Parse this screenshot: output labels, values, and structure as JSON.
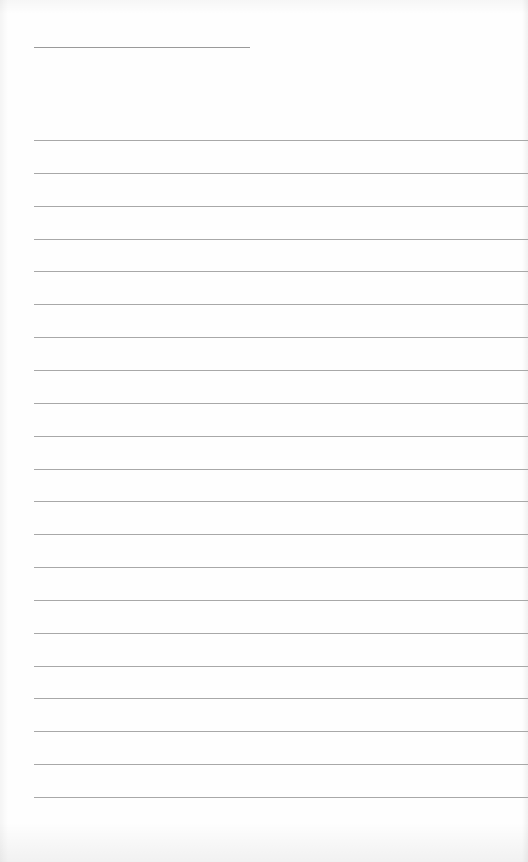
{
  "page": {
    "type": "lined-paper",
    "background_color": "#fefefe",
    "line_color": "#a8a8a8",
    "title_line": {
      "x": 34,
      "y": 47,
      "width": 216,
      "text": ""
    },
    "ruled_lines": {
      "count": 21,
      "first_y": 140,
      "spacing": 32.85,
      "left": 34,
      "lines_text": [
        "",
        "",
        "",
        "",
        "",
        "",
        "",
        "",
        "",
        "",
        "",
        "",
        "",
        "",
        "",
        "",
        "",
        "",
        "",
        "",
        ""
      ]
    }
  }
}
